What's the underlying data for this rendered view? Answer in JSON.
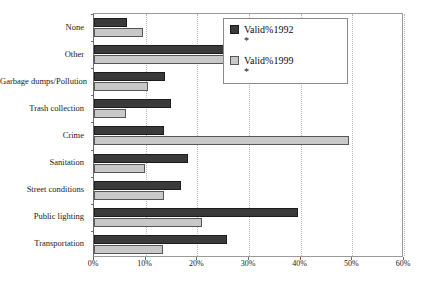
{
  "chart_data": {
    "type": "bar",
    "orientation": "horizontal",
    "title": "",
    "xlabel": "",
    "ylabel": "",
    "xlim": [
      0,
      60
    ],
    "xtick_labels": [
      "0%",
      "10%",
      "20%",
      "30%",
      "40%",
      "50%",
      "60%"
    ],
    "xticks": [
      0,
      10,
      20,
      30,
      40,
      50,
      60
    ],
    "grid": "vertical-dotted",
    "legend_position": "top-right-inside",
    "categories": [
      "None",
      "Other",
      "Garbage dumps/Pollution",
      "Trash collection",
      "Crime",
      "Sanitation",
      "Street conditions",
      "Public lighting",
      "Transportation"
    ],
    "series": [
      {
        "name": "Valid%1992",
        "note": "*",
        "color": "#3a3a3a",
        "values": [
          6.4,
          28.0,
          13.7,
          14.9,
          13.5,
          18.2,
          16.8,
          39.5,
          25.7
        ]
      },
      {
        "name": "Valid%1999",
        "note": "*",
        "color": "#c8c8c8",
        "values": [
          9.5,
          26.1,
          10.4,
          6.2,
          49.3,
          9.9,
          13.5,
          20.9,
          13.3
        ]
      }
    ]
  }
}
